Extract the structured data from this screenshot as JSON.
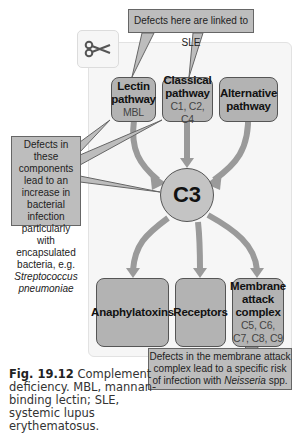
{
  "figure": {
    "number": "Fig. 19.12",
    "caption": "Complement deficiency. MBL, mannan-binding lectin; SLE, systemic lupus erythematosus."
  },
  "callouts": {
    "sle": "Defects here are linked to SLE",
    "left_1": "Defects in these components lead to an increase in bacterial infection particularly with encapsulated bacteria, e.g.",
    "left_species": "Streptococcus pneumoniae",
    "mac_1": "Defects in the membrane attack complex lead to a specific risk of infection with",
    "mac_species": "Neisseria",
    "mac_suffix": "spp."
  },
  "pathways": [
    {
      "title": "Lectin pathway",
      "sub": "MBL"
    },
    {
      "title": "Classical pathway",
      "sub": "C1, C2, C4"
    },
    {
      "title": "Alternative pathway",
      "sub": ""
    }
  ],
  "center": {
    "label": "C3"
  },
  "outputs": [
    {
      "title": "Anaphylatoxins",
      "sub": ""
    },
    {
      "title": "Receptors",
      "sub": ""
    },
    {
      "title": "Membrane attack complex",
      "sub": "C5, C6, C7, C8, C9"
    }
  ],
  "icons": {
    "scissors": "scissors-icon"
  },
  "colors": {
    "node_fill": "#b3b3b3",
    "callout_fill": "#bdbdbd",
    "arrow": "#9a9a9a",
    "panel": "#f6f6f6"
  }
}
